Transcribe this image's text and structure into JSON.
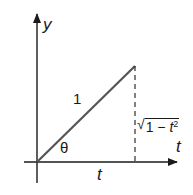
{
  "diagram": {
    "type": "right-triangle-trig-substitution",
    "axes": {
      "y_label": "y",
      "x_label": "t"
    },
    "triangle": {
      "hypotenuse_label": "1",
      "angle_label": "θ",
      "adjacent_label": "t",
      "opposite_label": {
        "radical": "√",
        "radicand_prefix": "1 − ",
        "radicand_var": "t",
        "radicand_exp": "2"
      }
    },
    "colors": {
      "ink": "#1a1a1a",
      "hypotenuse": "#555555",
      "background": "#ffffff"
    }
  }
}
